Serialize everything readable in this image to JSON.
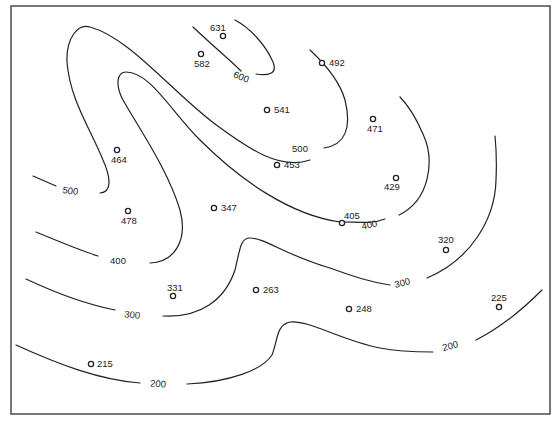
{
  "map": {
    "type": "contour_map",
    "contour_interval": 100,
    "frame": {
      "x": 11,
      "y": 6,
      "width": 539,
      "height": 408
    },
    "colors": {
      "line": "#222222",
      "frame": "#555555",
      "background": "#ffffff"
    },
    "contour_labels": [
      {
        "id": "c600",
        "text": "600",
        "x": 240,
        "y": 80,
        "rotate": 22
      },
      {
        "id": "c500a",
        "text": "500",
        "x": 300,
        "y": 152,
        "rotate": 0
      },
      {
        "id": "c500b",
        "text": "500",
        "x": 70,
        "y": 194,
        "rotate": 8
      },
      {
        "id": "c400a",
        "text": "400",
        "x": 118,
        "y": 264,
        "rotate": 0
      },
      {
        "id": "c400b",
        "text": "400",
        "x": 370,
        "y": 228,
        "rotate": -12
      },
      {
        "id": "c300a",
        "text": "300",
        "x": 132,
        "y": 318,
        "rotate": 6
      },
      {
        "id": "c300b",
        "text": "300",
        "x": 403,
        "y": 286,
        "rotate": -14
      },
      {
        "id": "c200a",
        "text": "200",
        "x": 158,
        "y": 387,
        "rotate": 4
      },
      {
        "id": "c200b",
        "text": "200",
        "x": 451,
        "y": 349,
        "rotate": -14
      }
    ],
    "points": [
      {
        "value": "631",
        "cx": 223,
        "cy": 36,
        "lx": 210,
        "ly": 31
      },
      {
        "value": "582",
        "cx": 201,
        "cy": 54,
        "lx": 194,
        "ly": 67
      },
      {
        "value": "492",
        "cx": 322,
        "cy": 63,
        "lx": 329,
        "ly": 66
      },
      {
        "value": "541",
        "cx": 267,
        "cy": 110,
        "lx": 274,
        "ly": 113
      },
      {
        "value": "471",
        "cx": 373,
        "cy": 119,
        "lx": 367,
        "ly": 132
      },
      {
        "value": "464",
        "cx": 117,
        "cy": 150,
        "lx": 111,
        "ly": 163
      },
      {
        "value": "453",
        "cx": 277,
        "cy": 165,
        "lx": 284,
        "ly": 168
      },
      {
        "value": "429",
        "cx": 396,
        "cy": 178,
        "lx": 384,
        "ly": 190
      },
      {
        "value": "478",
        "cx": 128,
        "cy": 211,
        "lx": 121,
        "ly": 224
      },
      {
        "value": "347",
        "cx": 214,
        "cy": 208,
        "lx": 221,
        "ly": 211
      },
      {
        "value": "405",
        "cx": 342,
        "cy": 223,
        "lx": 344,
        "ly": 219
      },
      {
        "value": "320",
        "cx": 446,
        "cy": 250,
        "lx": 438,
        "ly": 243
      },
      {
        "value": "331",
        "cx": 173,
        "cy": 296,
        "lx": 167,
        "ly": 291
      },
      {
        "value": "263",
        "cx": 256,
        "cy": 290,
        "lx": 263,
        "ly": 293
      },
      {
        "value": "248",
        "cx": 349,
        "cy": 309,
        "lx": 356,
        "ly": 312
      },
      {
        "value": "225",
        "cx": 499,
        "cy": 307,
        "lx": 491,
        "ly": 301
      },
      {
        "value": "215",
        "cx": 91,
        "cy": 364,
        "lx": 97,
        "ly": 367
      }
    ]
  }
}
